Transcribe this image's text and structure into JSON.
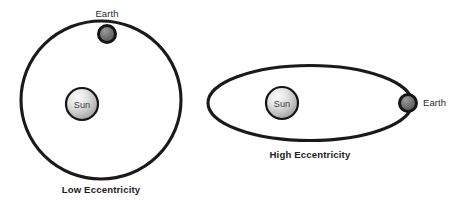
{
  "diagram": {
    "background_color": "#ffffff",
    "stroke_color": "#1a1a1a",
    "label_color": "#2b2b2b",
    "panels": [
      {
        "id": "low-eccentricity",
        "caption": "Low Eccentricity",
        "orbit": {
          "shape": "circle",
          "center_x": 101,
          "center_y": 100,
          "rx": 80,
          "ry": 79,
          "stroke_width": 3.1
        },
        "sun": {
          "label": "Sun",
          "center_x": 82,
          "center_y": 104,
          "radius": 16,
          "fill_light": "#f2f2f2",
          "fill_dark": "#9a9a9a",
          "outline": "#141414"
        },
        "earth": {
          "label": "Earth",
          "center_x": 107,
          "center_y": 34,
          "radius": 8.5,
          "fill_light": "#8b8b8b",
          "fill_dark": "#4f4f4f",
          "outline": "#141414",
          "label_x": 107,
          "label_y": 17,
          "label_anchor": "middle"
        },
        "caption_x": 101,
        "caption_y": 193
      },
      {
        "id": "high-eccentricity",
        "caption": "High Eccentricity",
        "orbit": {
          "shape": "ellipse",
          "center_x": 310,
          "center_y": 103,
          "rx": 102,
          "ry": 37.5,
          "stroke_width": 3.1
        },
        "sun": {
          "label": "Sun",
          "center_x": 282,
          "center_y": 103,
          "radius": 16,
          "fill_light": "#f2f2f2",
          "fill_dark": "#9a9a9a",
          "outline": "#141414"
        },
        "earth": {
          "label": "Earth",
          "center_x": 408,
          "center_y": 103,
          "radius": 8.5,
          "fill_light": "#8b8b8b",
          "fill_dark": "#4f4f4f",
          "outline": "#141414",
          "label_x": 423,
          "label_y": 106,
          "label_anchor": "start"
        },
        "caption_x": 310,
        "caption_y": 158
      }
    ]
  }
}
